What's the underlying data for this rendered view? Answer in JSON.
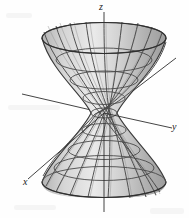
{
  "figure": {
    "caption_present": false,
    "background_color": "#fefefe",
    "surface": {
      "name": "hyperboloid-of-one-sheet",
      "fill_color": "#c9c9c9",
      "fill_color_light": "#e3e3e3",
      "fill_color_dark": "#a8a8a8",
      "mesh_color": "#4a4a4a",
      "outline_color": "#3a3a3a",
      "waist_center_x": 104,
      "waist_center_y": 113,
      "waist_radius_x": 13,
      "waist_radius_y": 5,
      "top_rim_y": 38,
      "top_rim_radius_x": 62,
      "top_rim_radius_y": 15,
      "bottom_rim_y": 182,
      "bottom_rim_radius_x": 62,
      "bottom_rim_radius_y": 15,
      "ruling_count": 22,
      "ring_count": 9
    },
    "axes": [
      {
        "name": "z-axis",
        "label": "z",
        "label_x": 99,
        "label_y": 2,
        "x1": 104,
        "y1": 12,
        "x2": 104,
        "y2": 212,
        "color": "#2a2a2a"
      },
      {
        "name": "y-axis",
        "label": "y",
        "label_x": 172,
        "label_y": 122,
        "x1": 22,
        "y1": 94,
        "x2": 172,
        "y2": 130,
        "color": "#2a2a2a"
      },
      {
        "name": "x-axis",
        "label": "x",
        "label_x": 23,
        "label_y": 177,
        "x1": 176,
        "y1": 58,
        "x2": 27,
        "y2": 181,
        "color": "#2a2a2a"
      }
    ],
    "labels": {
      "z": "z",
      "y": "y",
      "x": "x"
    }
  }
}
